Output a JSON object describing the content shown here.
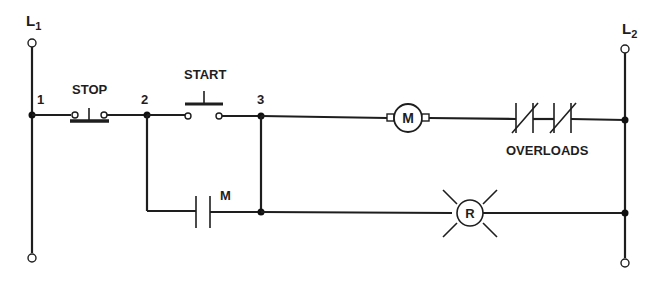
{
  "diagram": {
    "type": "ladder-diagram",
    "title": "",
    "rails": {
      "left": {
        "label": "L",
        "subscript": "1"
      },
      "right": {
        "label": "L",
        "subscript": "2"
      }
    },
    "wire_numbers": [
      "1",
      "2",
      "3"
    ],
    "components": {
      "stop": {
        "label": "STOP",
        "kind": "normally-closed pushbutton"
      },
      "start": {
        "label": "START",
        "kind": "normally-open pushbutton"
      },
      "motor": {
        "label": "M",
        "kind": "motor"
      },
      "overloads": {
        "label": "OVERLOADS",
        "kind": "normally-closed overload contacts (x2)"
      },
      "seal_contact": {
        "label": "M",
        "kind": "normally-open auxiliary contact"
      },
      "lamp": {
        "label": "R",
        "kind": "pilot light (red)"
      }
    },
    "colors": {
      "line": "#1e1e1e",
      "background": "#ffffff"
    }
  }
}
